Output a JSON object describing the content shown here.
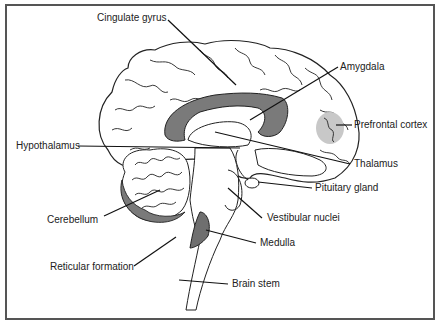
{
  "diagram": {
    "colors": {
      "frame": "#555555",
      "outline": "#222222",
      "dark_fill": "#7a7a7a",
      "light_fill": "#c8c8c8",
      "background": "#ffffff"
    },
    "labels": {
      "cingulate_gyrus": "Cingulate gyrus",
      "amygdala": "Amygdala",
      "prefrontal_cortex": "Prefrontal cortex",
      "hypothalamus": "Hypothalamus",
      "thalamus": "Thalamus",
      "pituitary_gland": "Pituitary gland",
      "cerebellum": "Cerebellum",
      "vestibular_nuclei": "Vestibular nuclei",
      "medulla": "Medulla",
      "reticular_formation": "Reticular formation",
      "brain_stem": "Brain stem"
    }
  }
}
